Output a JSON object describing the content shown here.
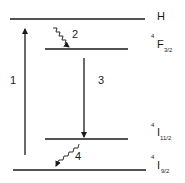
{
  "diagram": {
    "type": "energy-level-diagram",
    "levels": [
      {
        "id": "H",
        "label": "H",
        "superscript": "",
        "main": "H",
        "subscript": ""
      },
      {
        "id": "F3/2",
        "label": "4F3/2",
        "superscript": "4",
        "main": "F",
        "subscript": "3/2"
      },
      {
        "id": "I11/2",
        "label": "4I11/2",
        "superscript": "4",
        "main": "I",
        "subscript": "11/2"
      },
      {
        "id": "I9/2",
        "label": "4I9/2",
        "superscript": "4",
        "main": "I",
        "subscript": "9/2"
      }
    ],
    "transitions": [
      {
        "number": "1",
        "from": "I9/2",
        "to": "H",
        "style": "straight",
        "direction": "up"
      },
      {
        "number": "2",
        "from": "H",
        "to": "F3/2",
        "style": "wavy",
        "direction": "down"
      },
      {
        "number": "3",
        "from": "F3/2",
        "to": "I11/2",
        "style": "straight",
        "direction": "down"
      },
      {
        "number": "4",
        "from": "I11/2",
        "to": "I9/2",
        "style": "wavy",
        "direction": "down"
      }
    ],
    "line_color": "#1a1a1a"
  }
}
